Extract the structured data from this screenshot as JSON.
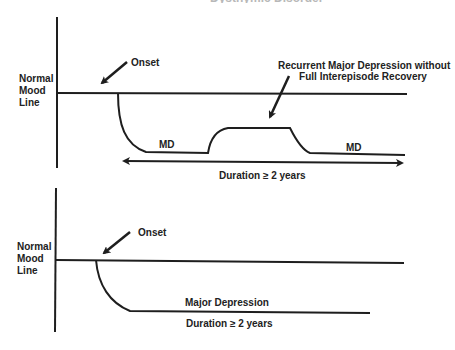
{
  "header": {
    "cropped_heading": "Dysthymic Disorder"
  },
  "colors": {
    "line": "#1e1e1e",
    "background": "#ffffff"
  },
  "panel_top": {
    "axis_label": [
      "Normal",
      "Mood",
      "Line"
    ],
    "onset_label": "Onset",
    "annotation_line1": "Recurrent Major Depression without",
    "annotation_line2": "Full Interepisode Recovery",
    "episode1_label": "MD",
    "episode2_label": "MD",
    "duration_label": "Duration ≥ 2 years"
  },
  "panel_bottom": {
    "axis_label": [
      "Normal",
      "Mood",
      "Line"
    ],
    "onset_label": "Onset",
    "episode_label": "Major Depression",
    "duration_label": "Duration ≥ 2 years"
  },
  "icons": {
    "onset_arrow": "arrow-down-left-icon",
    "annotation_arrow": "arrow-down-left-icon",
    "duration_arrow": "double-headed-arrow-icon"
  }
}
